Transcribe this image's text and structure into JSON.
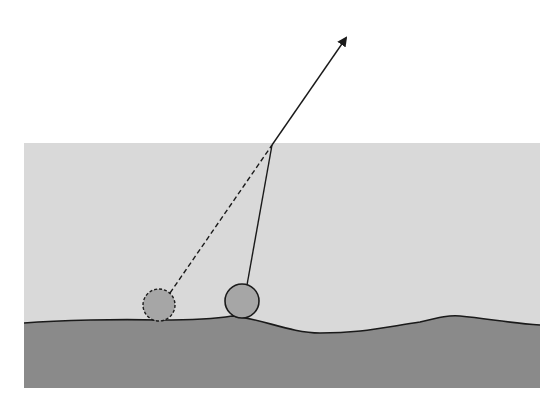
{
  "diagram": {
    "colors": {
      "background": "#ffffff",
      "sky": "#d9d9d9",
      "ground": "#8a8a8a",
      "ball": "#a6a6a6",
      "line": "#1a1a1a"
    },
    "panel": {
      "x": 24,
      "y": 143,
      "width": 516,
      "height": 245
    },
    "pivot": {
      "x": 272,
      "y": 145
    },
    "arrow_tip": {
      "x": 348,
      "y": 36
    },
    "ball_previous": {
      "cx": 159,
      "cy": 305,
      "r": 16,
      "style": "dashed"
    },
    "ball_current": {
      "cx": 242,
      "cy": 301,
      "r": 17,
      "style": "solid"
    }
  }
}
